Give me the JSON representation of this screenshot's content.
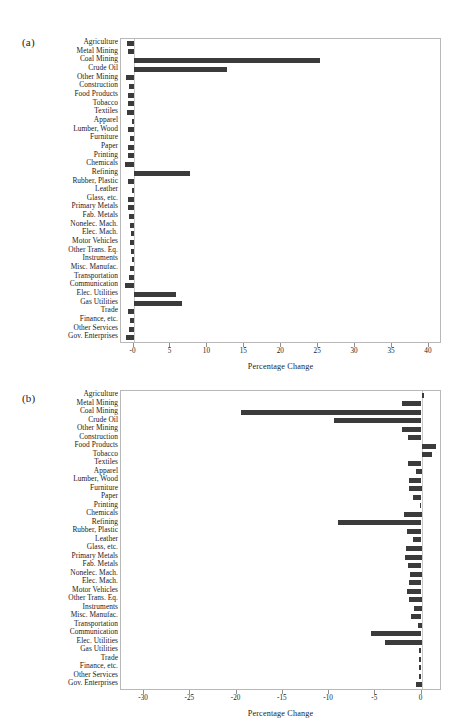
{
  "figure": {
    "panel_a_tag": "(a)",
    "panel_b_tag": "(b)"
  },
  "categories": [
    "Agriculture",
    "Metal Mining",
    "Coal Mining",
    "Crude Oil",
    "Other Mining",
    "Construction",
    "Food Products",
    "Tobacco",
    "Textiles",
    "Apparel",
    "Lumber, Wood",
    "Furniture",
    "Paper",
    "Printing",
    "Chemicals",
    "Refining",
    "Rubber, Plastic",
    "Leather",
    "Glass, etc.",
    "Primary Metals",
    "Fab. Metals",
    "Nonelec. Mach.",
    "Elec. Mach.",
    "Motor Vehicles",
    "Other Trans. Eq.",
    "Instruments",
    "Misc. Manufac.",
    "Transportation",
    "Communication",
    "Elec. Utilities",
    "Gas Utilities",
    "Trade",
    "Finance, etc.",
    "Other Services",
    "Gov. Enterprises"
  ],
  "chart_data": [
    {
      "type": "bar",
      "orientation": "horizontal",
      "panel": "(a)",
      "title": "",
      "xlabel": "Percentage Change",
      "ylabel": "",
      "xlim": [
        -1.7,
        41.5
      ],
      "xticks": [
        0,
        5,
        10,
        15,
        20,
        25,
        30,
        35,
        40
      ],
      "xticklabels": [
        "-0",
        "5",
        "10",
        "15",
        "20",
        "25",
        "30",
        "35",
        "40"
      ],
      "grid": false,
      "legend": null,
      "bar_color": "#3b3b3b",
      "categories": [
        "Agriculture",
        "Metal Mining",
        "Coal Mining",
        "Crude Oil",
        "Other Mining",
        "Construction",
        "Food Products",
        "Tobacco",
        "Textiles",
        "Apparel",
        "Lumber, Wood",
        "Furniture",
        "Paper",
        "Printing",
        "Chemicals",
        "Refining",
        "Rubber, Plastic",
        "Leather",
        "Glass, etc.",
        "Primary Metals",
        "Fab. Metals",
        "Nonelec. Mach.",
        "Elec. Mach.",
        "Motor Vehicles",
        "Other Trans. Eq.",
        "Instruments",
        "Misc. Manufac.",
        "Transportation",
        "Communication",
        "Elec. Utilities",
        "Gas Utilities",
        "Trade",
        "Finance, etc.",
        "Other Services",
        "Gov. Enterprises"
      ],
      "values": [
        -0.9,
        -0.8,
        25.2,
        12.7,
        -1.0,
        -0.6,
        -0.7,
        -0.8,
        -0.9,
        -0.2,
        -0.7,
        -0.5,
        -0.8,
        -0.7,
        -1.2,
        7.6,
        -0.8,
        -0.15,
        -0.7,
        -0.8,
        -0.6,
        -0.5,
        -0.4,
        -0.5,
        -0.3,
        -0.2,
        -0.5,
        -0.6,
        -1.1,
        5.8,
        6.5,
        -0.8,
        -0.5,
        -0.6,
        -1.0
      ]
    },
    {
      "type": "bar",
      "orientation": "horizontal",
      "panel": "(b)",
      "title": "",
      "xlabel": "Percentage Change",
      "ylabel": "",
      "xlim": [
        -32.5,
        2.0
      ],
      "xticks": [
        -30,
        -25,
        -20,
        -15,
        -10,
        -5,
        0
      ],
      "xticklabels": [
        "-30",
        "-25",
        "-20",
        "-15",
        "-10",
        "-5",
        "0"
      ],
      "grid": false,
      "legend": null,
      "bar_color": "#3b3b3b",
      "categories": [
        "Agriculture",
        "Metal Mining",
        "Coal Mining",
        "Crude Oil",
        "Other Mining",
        "Construction",
        "Food Products",
        "Tobacco",
        "Textiles",
        "Apparel",
        "Lumber, Wood",
        "Furniture",
        "Paper",
        "Printing",
        "Chemicals",
        "Refining",
        "Rubber, Plastic",
        "Leather",
        "Glass, etc.",
        "Primary Metals",
        "Fab. Metals",
        "Nonelec. Mach.",
        "Elec. Mach.",
        "Motor Vehicles",
        "Other Trans. Eq.",
        "Instruments",
        "Misc. Manufac.",
        "Transportation",
        "Communication",
        "Elec. Utilities",
        "Gas Utilities",
        "Trade",
        "Finance, etc.",
        "Other Services",
        "Gov. Enterprises"
      ],
      "values": [
        0.25,
        -2.1,
        -19.5,
        -9.5,
        -2.1,
        -1.5,
        1.6,
        1.1,
        -1.5,
        -0.6,
        -1.4,
        -1.3,
        -0.9,
        -0.15,
        -1.9,
        -9.0,
        -1.6,
        -0.9,
        -1.7,
        -1.8,
        -1.5,
        -1.2,
        -1.4,
        -1.6,
        -1.3,
        -0.8,
        -1.1,
        -0.35,
        -5.5,
        -4.0,
        -0.3,
        -0.3,
        -0.25,
        -0.3,
        -0.6
      ]
    }
  ]
}
